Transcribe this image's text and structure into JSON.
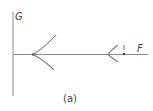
{
  "figure": {
    "caption": "(a)",
    "axes": {
      "vertical_label": "G",
      "horizontal_label": "F"
    },
    "marker": {
      "symbol": "!"
    },
    "colors": {
      "line": "#7a7a7a",
      "text": "#444444",
      "background": "#ffffff"
    }
  }
}
